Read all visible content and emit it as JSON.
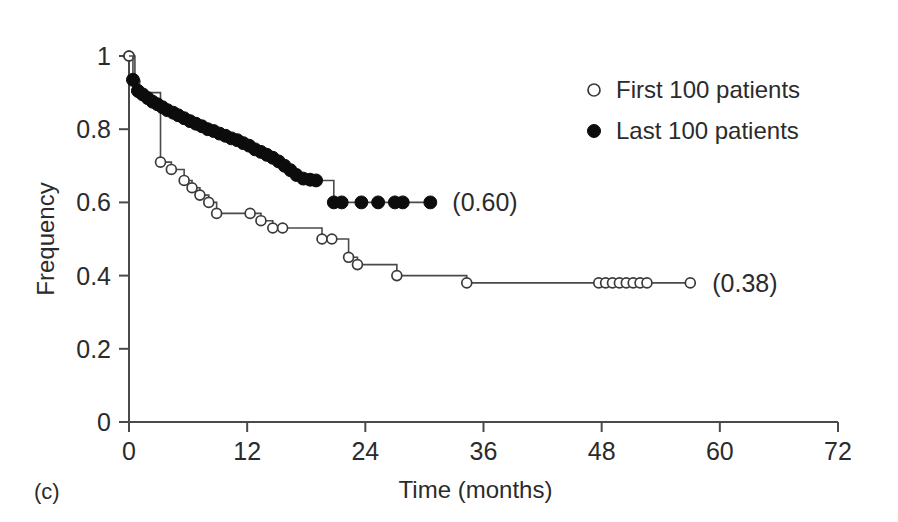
{
  "panel": {
    "label": "(c)"
  },
  "chart_data": {
    "type": "line",
    "subtype": "kaplan-meier-survival-step",
    "title": "",
    "xlabel": "Time (months)",
    "ylabel": "Frequency",
    "xlim": [
      0,
      72
    ],
    "ylim": [
      0,
      1
    ],
    "xticks": [
      0,
      12,
      24,
      36,
      48,
      60,
      72
    ],
    "xtick_labels": [
      "0",
      "12",
      "24",
      "36",
      "48",
      "60",
      "72"
    ],
    "yticks": [
      0,
      0.2,
      0.4,
      0.6,
      0.8,
      1
    ],
    "ytick_labels": [
      "0",
      "0.2",
      "0.4",
      "0.6",
      "0.8",
      "1"
    ],
    "grid": false,
    "legend_position": "upper-right",
    "series": [
      {
        "name": "First 100 patients",
        "marker": "open-circle",
        "marker_size": 7.5,
        "final_value_label": "(0.38)",
        "final_value": 0.38,
        "points": [
          [
            0.0,
            1.0
          ],
          [
            0.6,
            0.93
          ],
          [
            1.0,
            0.9
          ],
          [
            3.2,
            0.71
          ],
          [
            4.3,
            0.69
          ],
          [
            5.6,
            0.66
          ],
          [
            6.4,
            0.64
          ],
          [
            7.2,
            0.62
          ],
          [
            8.1,
            0.6
          ],
          [
            8.9,
            0.57
          ],
          [
            12.3,
            0.57
          ],
          [
            13.4,
            0.55
          ],
          [
            14.6,
            0.53
          ],
          [
            15.6,
            0.53
          ],
          [
            19.6,
            0.5
          ],
          [
            20.6,
            0.5
          ],
          [
            22.3,
            0.45
          ],
          [
            23.2,
            0.43
          ],
          [
            27.2,
            0.4
          ],
          [
            34.3,
            0.38
          ],
          [
            47.7,
            0.38
          ],
          [
            48.4,
            0.38
          ],
          [
            49.1,
            0.38
          ],
          [
            49.8,
            0.38
          ],
          [
            50.5,
            0.38
          ],
          [
            51.2,
            0.38
          ],
          [
            51.9,
            0.38
          ],
          [
            52.6,
            0.38
          ],
          [
            57.0,
            0.38
          ]
        ]
      },
      {
        "name": "Last 100 patients",
        "marker": "filled-circle",
        "marker_size": 8.5,
        "final_value_label": "(0.60)",
        "final_value": 0.6,
        "points": [
          [
            0.4,
            0.935
          ],
          [
            0.9,
            0.905
          ],
          [
            1.4,
            0.895
          ],
          [
            1.9,
            0.885
          ],
          [
            2.4,
            0.875
          ],
          [
            2.9,
            0.868
          ],
          [
            3.4,
            0.86
          ],
          [
            3.9,
            0.852
          ],
          [
            4.5,
            0.845
          ],
          [
            5.0,
            0.838
          ],
          [
            5.6,
            0.83
          ],
          [
            6.2,
            0.822
          ],
          [
            6.8,
            0.815
          ],
          [
            7.4,
            0.808
          ],
          [
            8.0,
            0.8
          ],
          [
            8.6,
            0.795
          ],
          [
            9.2,
            0.788
          ],
          [
            9.8,
            0.782
          ],
          [
            10.4,
            0.775
          ],
          [
            11.0,
            0.77
          ],
          [
            11.6,
            0.762
          ],
          [
            12.2,
            0.755
          ],
          [
            12.8,
            0.745
          ],
          [
            13.4,
            0.738
          ],
          [
            14.0,
            0.73
          ],
          [
            14.6,
            0.722
          ],
          [
            15.2,
            0.712
          ],
          [
            15.8,
            0.7
          ],
          [
            16.4,
            0.688
          ],
          [
            17.0,
            0.675
          ],
          [
            17.7,
            0.665
          ],
          [
            18.4,
            0.662
          ],
          [
            19.0,
            0.66
          ],
          [
            20.8,
            0.6
          ],
          [
            21.6,
            0.6
          ],
          [
            23.6,
            0.6
          ],
          [
            25.3,
            0.6
          ],
          [
            27.0,
            0.6
          ],
          [
            27.8,
            0.6
          ],
          [
            30.6,
            0.6
          ]
        ]
      }
    ]
  },
  "legend": {
    "items": [
      {
        "marker": "open-circle",
        "label": "First 100 patients"
      },
      {
        "marker": "filled-circle",
        "label": "Last 100 patients"
      }
    ]
  }
}
